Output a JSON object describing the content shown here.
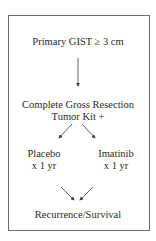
{
  "flowchart": {
    "nodes": {
      "eligibility": "Primary GIST ≥ 3 cm",
      "resection_line1": "Complete Gross Resection",
      "resection_line2": "Tumor Kit +",
      "placebo_line1": "Placebo",
      "placebo_line2": "x 1 yr",
      "imatinib_line1": "Imatinib",
      "imatinib_line2": "x 1 yr",
      "outcome": "Recurrence/Survival"
    },
    "edges": [
      {
        "from": "eligibility",
        "to": "resection"
      },
      {
        "from": "resection",
        "to": "placebo"
      },
      {
        "from": "resection",
        "to": "imatinib"
      },
      {
        "from": "placebo",
        "to": "outcome"
      },
      {
        "from": "imatinib",
        "to": "outcome"
      }
    ],
    "colors": {
      "line": "#3a3a3a",
      "border": "#6e6e6e",
      "text": "#2a2a2a"
    }
  }
}
